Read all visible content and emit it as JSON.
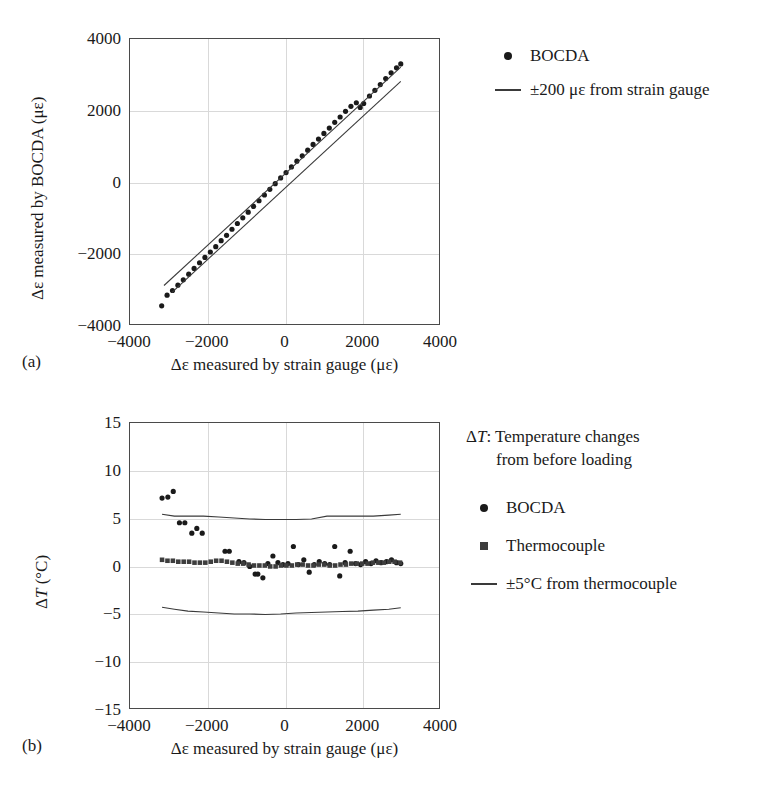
{
  "figure": {
    "panels": [
      {
        "letter": "(a)",
        "xlabel": "Δε measured by strain gauge (με)",
        "ylabel": "Δε measured by BOCDA (με)",
        "xticks": [
          "-4000",
          "-2000",
          "0",
          "2000",
          "4000"
        ],
        "yticks": [
          "4000",
          "2000",
          "0",
          "-2000",
          "-4000"
        ],
        "legend": [
          {
            "marker": "circle",
            "label": "BOCDA"
          },
          {
            "marker": "line",
            "label": "±200 με from strain gauge"
          }
        ]
      },
      {
        "letter": "(b)",
        "xlabel": "Δε measured by strain gauge (με)",
        "ylabel": "ΔT (°C)",
        "ylabel_italic_part": "T",
        "xticks": [
          "-4000",
          "-2000",
          "0",
          "2000",
          "4000"
        ],
        "yticks": [
          "15",
          "10",
          "5",
          "0",
          "-5",
          "-10",
          "-15"
        ],
        "note_line1": "ΔT: Temperature changes",
        "note_line2": "from before loading",
        "legend": [
          {
            "marker": "circle",
            "label": "BOCDA"
          },
          {
            "marker": "square",
            "label": "Thermocouple"
          },
          {
            "marker": "line",
            "label": "±5°C from thermocouple"
          }
        ]
      }
    ]
  },
  "chart_data": [
    {
      "id": "panel-a",
      "type": "scatter",
      "title": "",
      "xlabel": "Δε measured by strain gauge (με)",
      "ylabel": "Δε measured by BOCDA (με)",
      "xlim": [
        -4000,
        4000
      ],
      "ylim": [
        -4000,
        4000
      ],
      "xticks": [
        -4000,
        -2000,
        0,
        2000,
        4000
      ],
      "yticks": [
        -4000,
        -2000,
        0,
        2000,
        4000
      ],
      "grid": true,
      "legend_position": "right",
      "series": [
        {
          "name": "BOCDA",
          "marker": "circle",
          "color": "#1a1a1a",
          "points": [
            [
              -3180,
              -3490
            ],
            [
              -3040,
              -3190
            ],
            [
              -2900,
              -3060
            ],
            [
              -2760,
              -2910
            ],
            [
              -2620,
              -2760
            ],
            [
              -2480,
              -2600
            ],
            [
              -2340,
              -2440
            ],
            [
              -2200,
              -2280
            ],
            [
              -2060,
              -2130
            ],
            [
              -1920,
              -1980
            ],
            [
              -1780,
              -1830
            ],
            [
              -1640,
              -1660
            ],
            [
              -1500,
              -1510
            ],
            [
              -1360,
              -1340
            ],
            [
              -1220,
              -1180
            ],
            [
              -1080,
              -1020
            ],
            [
              -940,
              -860
            ],
            [
              -800,
              -700
            ],
            [
              -660,
              -540
            ],
            [
              -520,
              -380
            ],
            [
              -380,
              -220
            ],
            [
              -240,
              -60
            ],
            [
              -100,
              100
            ],
            [
              40,
              250
            ],
            [
              180,
              410
            ],
            [
              320,
              570
            ],
            [
              460,
              720
            ],
            [
              600,
              880
            ],
            [
              740,
              1040
            ],
            [
              880,
              1190
            ],
            [
              1020,
              1350
            ],
            [
              1160,
              1500
            ],
            [
              1300,
              1660
            ],
            [
              1440,
              1810
            ],
            [
              1580,
              1970
            ],
            [
              1720,
              2110
            ],
            [
              1860,
              2210
            ],
            [
              1960,
              2080
            ],
            [
              2050,
              2190
            ],
            [
              2200,
              2400
            ],
            [
              2340,
              2560
            ],
            [
              2480,
              2720
            ],
            [
              2620,
              2890
            ],
            [
              2760,
              3050
            ],
            [
              2900,
              3190
            ],
            [
              3010,
              3300
            ]
          ]
        },
        {
          "name": "+200 με bound",
          "type": "line",
          "color": "#3a3a3a",
          "points": [
            [
              -3120,
              -2920
            ],
            [
              3010,
              3210
            ]
          ]
        },
        {
          "name": "-200 με bound",
          "type": "line",
          "color": "#3a3a3a",
          "points": [
            [
              -2920,
              -3120
            ],
            [
              3010,
              2810
            ]
          ]
        }
      ]
    },
    {
      "id": "panel-b",
      "type": "scatter",
      "title": "",
      "xlabel": "Δε measured by strain gauge (με)",
      "ylabel": "ΔT (°C)",
      "xlim": [
        -4000,
        4000
      ],
      "ylim": [
        -15,
        15
      ],
      "xticks": [
        -4000,
        -2000,
        0,
        2000,
        4000
      ],
      "yticks": [
        -15,
        -10,
        -5,
        0,
        5,
        10,
        15
      ],
      "grid": true,
      "legend_position": "right",
      "annotation": "ΔT: Temperature changes from before loading",
      "series": [
        {
          "name": "BOCDA",
          "marker": "circle",
          "color": "#1a1a1a",
          "points": [
            [
              -3170,
              7.1
            ],
            [
              -3020,
              7.2
            ],
            [
              -2880,
              7.8
            ],
            [
              -2720,
              4.5
            ],
            [
              -2580,
              4.5
            ],
            [
              -2400,
              3.4
            ],
            [
              -2270,
              3.9
            ],
            [
              -2130,
              3.4
            ],
            [
              -1540,
              1.5
            ],
            [
              -1430,
              1.5
            ],
            [
              -1180,
              0.4
            ],
            [
              -1050,
              0.3
            ],
            [
              -900,
              -0.1
            ],
            [
              -760,
              -0.9
            ],
            [
              -690,
              -0.9
            ],
            [
              -560,
              -1.3
            ],
            [
              -430,
              0.2
            ],
            [
              -300,
              1.0
            ],
            [
              -170,
              0.3
            ],
            [
              -40,
              0.1
            ],
            [
              90,
              0.2
            ],
            [
              230,
              2.0
            ],
            [
              360,
              0.1
            ],
            [
              500,
              0.6
            ],
            [
              640,
              -0.7
            ],
            [
              770,
              0.1
            ],
            [
              900,
              0.4
            ],
            [
              1040,
              0.2
            ],
            [
              1170,
              0.1
            ],
            [
              1300,
              2.0
            ],
            [
              1430,
              -1.1
            ],
            [
              1570,
              0.3
            ],
            [
              1700,
              1.5
            ],
            [
              1840,
              0.2
            ],
            [
              1970,
              0.1
            ],
            [
              2100,
              0.4
            ],
            [
              2240,
              0.2
            ],
            [
              2370,
              0.5
            ],
            [
              2500,
              0.3
            ],
            [
              2640,
              0.4
            ],
            [
              2770,
              0.6
            ],
            [
              2900,
              0.3
            ],
            [
              3010,
              0.2
            ]
          ]
        },
        {
          "name": "Thermocouple",
          "marker": "square",
          "color": "#3d3d3d",
          "points": [
            [
              -3170,
              0.6
            ],
            [
              -3030,
              0.5
            ],
            [
              -2890,
              0.5
            ],
            [
              -2750,
              0.4
            ],
            [
              -2610,
              0.4
            ],
            [
              -2470,
              0.4
            ],
            [
              -2330,
              0.3
            ],
            [
              -2190,
              0.3
            ],
            [
              -2050,
              0.3
            ],
            [
              -1910,
              0.4
            ],
            [
              -1770,
              0.5
            ],
            [
              -1630,
              0.5
            ],
            [
              -1490,
              0.4
            ],
            [
              -1350,
              0.3
            ],
            [
              -1210,
              0.2
            ],
            [
              -1070,
              0.2
            ],
            [
              -930,
              0.1
            ],
            [
              -790,
              0.0
            ],
            [
              -650,
              0.0
            ],
            [
              -510,
              0.0
            ],
            [
              -370,
              -0.1
            ],
            [
              -230,
              -0.1
            ],
            [
              -90,
              0.0
            ],
            [
              50,
              0.0
            ],
            [
              190,
              0.0
            ],
            [
              330,
              0.1
            ],
            [
              470,
              0.1
            ],
            [
              610,
              0.0
            ],
            [
              750,
              0.0
            ],
            [
              890,
              0.1
            ],
            [
              1030,
              0.1
            ],
            [
              1170,
              0.0
            ],
            [
              1310,
              0.0
            ],
            [
              1450,
              0.1
            ],
            [
              1590,
              0.1
            ],
            [
              1730,
              0.2
            ],
            [
              1870,
              0.2
            ],
            [
              2010,
              0.2
            ],
            [
              2150,
              0.2
            ],
            [
              2290,
              0.3
            ],
            [
              2430,
              0.3
            ],
            [
              2570,
              0.3
            ],
            [
              2710,
              0.4
            ],
            [
              2850,
              0.4
            ],
            [
              2990,
              0.3
            ]
          ]
        },
        {
          "name": "+5°C bound",
          "type": "line",
          "color": "#3a3a3a",
          "points": [
            [
              -3170,
              5.4
            ],
            [
              -2850,
              5.2
            ],
            [
              -2500,
              5.2
            ],
            [
              -2100,
              5.2
            ],
            [
              -1700,
              5.1
            ],
            [
              -1300,
              5.0
            ],
            [
              -900,
              4.9
            ],
            [
              -500,
              4.85
            ],
            [
              -100,
              4.85
            ],
            [
              300,
              4.85
            ],
            [
              700,
              4.9
            ],
            [
              1100,
              5.2
            ],
            [
              1500,
              5.2
            ],
            [
              1900,
              5.2
            ],
            [
              2300,
              5.2
            ],
            [
              2700,
              5.3
            ],
            [
              3010,
              5.4
            ]
          ]
        },
        {
          "name": "-5°C bound",
          "type": "line",
          "color": "#3a3a3a",
          "points": [
            [
              -3170,
              -4.4
            ],
            [
              -2850,
              -4.6
            ],
            [
              -2500,
              -4.8
            ],
            [
              -2100,
              -4.9
            ],
            [
              -1700,
              -5.0
            ],
            [
              -1300,
              -5.1
            ],
            [
              -900,
              -5.1
            ],
            [
              -500,
              -5.15
            ],
            [
              -100,
              -5.1
            ],
            [
              300,
              -5.0
            ],
            [
              700,
              -4.95
            ],
            [
              1100,
              -4.9
            ],
            [
              1500,
              -4.85
            ],
            [
              1900,
              -4.8
            ],
            [
              2300,
              -4.7
            ],
            [
              2700,
              -4.6
            ],
            [
              3010,
              -4.45
            ]
          ]
        }
      ]
    }
  ]
}
